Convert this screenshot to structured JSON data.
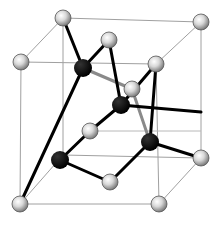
{
  "diagram": {
    "type": "crystal-lattice",
    "colors": {
      "cube_edge": "#9a9a9a",
      "bond": "#000000",
      "back_bond": "#8a8a8a",
      "grey_atom_light": "#f4f4f4",
      "grey_atom_dark": "#8c8c8c",
      "black_atom": "#000000"
    },
    "cube": {
      "back": [
        [
          63,
          18
        ],
        [
          201,
          22
        ],
        [
          157,
          160
        ],
        [
          20,
          158
        ]
      ],
      "front": [
        [
          21,
          62
        ],
        [
          157,
          65
        ],
        [
          158,
          205
        ],
        [
          20,
          205
        ]
      ]
    },
    "grey_atoms": [
      {
        "id": "g1",
        "x": 63,
        "y": 18
      },
      {
        "id": "g2",
        "x": 201,
        "y": 22
      },
      {
        "id": "g3",
        "x": 21,
        "y": 62
      },
      {
        "id": "g4",
        "x": 156,
        "y": 64
      },
      {
        "id": "g5",
        "x": 109,
        "y": 40
      },
      {
        "id": "g6",
        "x": 132,
        "y": 89
      },
      {
        "id": "g7",
        "x": 90,
        "y": 131
      },
      {
        "id": "g8",
        "x": 201,
        "y": 158
      },
      {
        "id": "g9",
        "x": 110,
        "y": 182
      },
      {
        "id": "g10",
        "x": 20,
        "y": 204
      },
      {
        "id": "g11",
        "x": 159,
        "y": 204
      }
    ],
    "black_atoms": [
      {
        "id": "b1",
        "x": 83,
        "y": 68
      },
      {
        "id": "b2",
        "x": 121,
        "y": 105
      },
      {
        "id": "b3",
        "x": 60,
        "y": 160
      },
      {
        "id": "b4",
        "x": 150,
        "y": 142
      }
    ],
    "bonds": [
      {
        "from": "b1",
        "to": "g1",
        "style": "front"
      },
      {
        "from": "b1",
        "to": "g5",
        "style": "front"
      },
      {
        "from": "b1",
        "to": "g6",
        "style": "back"
      },
      {
        "from": "b1",
        "to": "b3_via",
        "style": "front"
      },
      {
        "from": "b2",
        "to": "g5",
        "style": "front"
      },
      {
        "from": "b2",
        "to": "g4",
        "style": "front"
      },
      {
        "from": "b2",
        "to": "g7",
        "style": "front"
      },
      {
        "from": "b2",
        "to": "b4",
        "style": "front"
      },
      {
        "from": "g6",
        "to": "b4",
        "style": "back"
      },
      {
        "from": "b3",
        "to": "g7",
        "style": "front"
      },
      {
        "from": "b3",
        "to": "g10",
        "style": "front"
      },
      {
        "from": "b3",
        "to": "g9",
        "style": "front"
      },
      {
        "from": "b4",
        "to": "g8",
        "style": "front"
      },
      {
        "from": "b4",
        "to": "g11_up",
        "style": "front"
      }
    ]
  }
}
